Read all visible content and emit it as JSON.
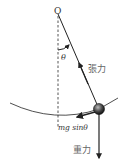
{
  "diagram": {
    "type": "simple-pendulum-force-diagram",
    "pivot_label": "O",
    "angle_label": "θ",
    "tension_label": "張力",
    "gravity_label": "重力",
    "tangential_component_label": "mg sinθ",
    "colors": {
      "line": "#222222",
      "dashed": "#555555",
      "bob": "#333333",
      "text": "#333333"
    }
  }
}
